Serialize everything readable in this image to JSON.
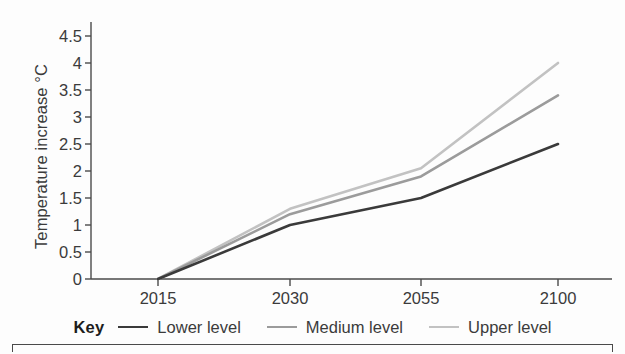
{
  "chart_data": {
    "type": "line",
    "title": "",
    "xlabel": "",
    "ylabel": "Temperature increase °C",
    "categories": [
      "2015",
      "2030",
      "2055",
      "2100"
    ],
    "x_tick_labels": [
      "2015",
      "2030",
      "2055",
      "2100"
    ],
    "y_tick_labels": [
      "0",
      "0.5",
      "1",
      "1.5",
      "2",
      "2.5",
      "3",
      "3.5",
      "4",
      "4.5"
    ],
    "y_tick_values": [
      0,
      0.5,
      1,
      1.5,
      2,
      2.5,
      3,
      3.5,
      4,
      4.5
    ],
    "ylim": [
      0,
      4.5
    ],
    "grid": false,
    "legend_position": "bottom",
    "legend_title": "Key",
    "series": [
      {
        "name": "Lower level",
        "color": "#3a3a3a",
        "width": 2.6,
        "values": [
          0,
          1.0,
          1.5,
          2.5
        ]
      },
      {
        "name": "Medium level",
        "color": "#9b9b9b",
        "width": 2.6,
        "values": [
          0,
          1.2,
          1.9,
          3.4
        ]
      },
      {
        "name": "Upper level",
        "color": "#c2c2c2",
        "width": 2.6,
        "values": [
          0,
          1.3,
          2.05,
          4.0
        ]
      }
    ]
  },
  "axis": {
    "line_color": "#4a4a4a"
  }
}
